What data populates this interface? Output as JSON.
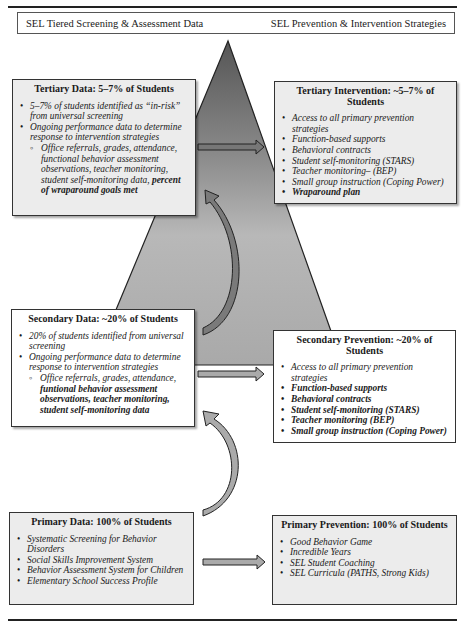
{
  "header": {
    "left_label": "SEL Tiered Screening & Assessment Data",
    "right_label": "SEL Prevention & Intervention Strategies"
  },
  "tiers": {
    "tertiary_data": {
      "title": "Tertiary Data: 5–7% of Students",
      "items": [
        "5–7% of students identified as “in-risk” from universal screening",
        "Ongoing performance data to determine response to intervention strategies"
      ],
      "sub_items_plain": "Office referrals, grades, attendance, functional behavior assessment observations, teacher monitoring, student self-monitoring data,",
      "sub_items_bold": "percent of wraparound goals met"
    },
    "tertiary_intervention": {
      "title": "Tertiary Intervention: ~5–7% of Students",
      "items": [
        "Access to all primary prevention strategies",
        "Function-based supports",
        "Behavioral contracts",
        "Student self-monitoring (STARS)",
        "Teacher monitoring– (BEP)",
        "Small group instruction (Coping Power)"
      ],
      "bold_item": "Wraparound plan"
    },
    "secondary_data": {
      "title": "Secondary Data: ~20% of Students",
      "items": [
        "20% of students identified from universal screening",
        "Ongoing performance data to determine response to intervention strategies"
      ],
      "sub_items_plain": "Office referrals, grades, attendance,",
      "sub_items_bold": "funtional behavior assessment observations, teacher monitoring, student self-monitoring data"
    },
    "secondary_prevention": {
      "title": "Secondary Prevention: ~20% of Students",
      "plain_item": "Access to all primary prevention strategies",
      "bold_items": [
        "Function-based supports",
        "Behavioral contracts",
        "Student self-monitoring (STARS)",
        "Teacher monitoring (BEP)",
        "Small group instruction (Coping Power)"
      ]
    },
    "primary_data": {
      "title": "Primary Data: 100% of Students",
      "items": [
        "Systematic Screening for Behavior Disorders",
        "Social Skills Improvement System",
        "Behavior Assessment System for Children",
        "Elementary School Success Profile"
      ]
    },
    "primary_prevention": {
      "title": "Primary Prevention: 100% of Students",
      "items": [
        "Good Behavior Game",
        "Incredible Years",
        "SEL Student Coaching",
        "SEL Curricula (PATHS, Strong Kids)"
      ]
    }
  },
  "colors": {
    "triangle_top": "#5a5a5a",
    "triangle_bottom": "#bdbdbd",
    "box_fill": "#ececec",
    "border": "#333333"
  }
}
